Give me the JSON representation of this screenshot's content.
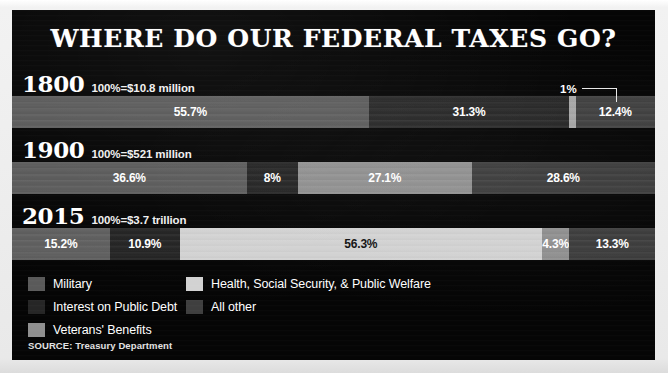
{
  "title": "WHERE DO OUR FEDERAL TAXES GO?",
  "source": "SOURCE: Treasury Department",
  "colors": {
    "panel_background": "#050505",
    "page_background": "#e9e9e9",
    "title_text": "#ffffff",
    "military": "#5a5a5a",
    "interest_on_public_debt": "#262626",
    "veterans_benefits": "#8f8f8f",
    "health_social_security_public_welfare": "#d2d2d2",
    "all_other": "#3f3f3f"
  },
  "callout": {
    "label": "1%",
    "refers_to_row": "1800",
    "refers_to_category": "Veterans' Benefits"
  },
  "legend": {
    "columns": [
      {
        "items": [
          {
            "label": "Military",
            "color": "#5a5a5a",
            "key": "military"
          },
          {
            "label": "Interest on Public Debt",
            "color": "#262626",
            "key": "interest"
          },
          {
            "label": "Veterans' Benefits",
            "color": "#8f8f8f",
            "key": "veterans"
          }
        ]
      },
      {
        "items": [
          {
            "label": "Health, Social Security, & Public Welfare",
            "color": "#d2d2d2",
            "key": "health"
          },
          {
            "label": "All other",
            "color": "#3f3f3f",
            "key": "other"
          }
        ]
      }
    ]
  },
  "rows": [
    {
      "year": "1800",
      "total": "100%=$10.8 million",
      "segments": [
        {
          "label": "55.7%",
          "value": 55.7,
          "key": "military",
          "color": "#5a5a5a",
          "text": "light"
        },
        {
          "label": "31.3%",
          "value": 31.3,
          "key": "interest",
          "color": "#262626",
          "text": "light"
        },
        {
          "label": "",
          "value": 1.0,
          "key": "veterans",
          "color": "#a6a6a6",
          "text": "dark"
        },
        {
          "label": "12.4%",
          "value": 12.4,
          "key": "other",
          "color": "#3f3f3f",
          "text": "light"
        }
      ]
    },
    {
      "year": "1900",
      "total": "100%=$521 million",
      "segments": [
        {
          "label": "36.6%",
          "value": 36.6,
          "key": "military",
          "color": "#5a5a5a",
          "text": "light"
        },
        {
          "label": "8%",
          "value": 8.0,
          "key": "interest",
          "color": "#222222",
          "text": "light"
        },
        {
          "label": "27.1%",
          "value": 27.1,
          "key": "veterans",
          "color": "#8f8f8f",
          "text": "light"
        },
        {
          "label": "28.6%",
          "value": 28.6,
          "key": "other",
          "color": "#3b3b3b",
          "text": "light"
        }
      ]
    },
    {
      "year": "2015",
      "total": "100%=$3.7 trillion",
      "segments": [
        {
          "label": "15.2%",
          "value": 15.2,
          "key": "military",
          "color": "#5e5e5e",
          "text": "light"
        },
        {
          "label": "10.9%",
          "value": 10.9,
          "key": "interest",
          "color": "#232323",
          "text": "light"
        },
        {
          "label": "56.3%",
          "value": 56.3,
          "key": "health",
          "color": "#d2d2d2",
          "text": "dark"
        },
        {
          "label": "4.3%",
          "value": 4.3,
          "key": "veterans",
          "color": "#8f8f8f",
          "text": "light"
        },
        {
          "label": "13.3%",
          "value": 13.3,
          "key": "other",
          "color": "#3b3b3b",
          "text": "light"
        }
      ]
    }
  ],
  "chart_data": {
    "type": "bar",
    "title": "WHERE DO OUR FEDERAL TAXES GO?",
    "subtype": "100% stacked horizontal bar",
    "xlabel": "",
    "ylabel": "",
    "xlim": [
      0,
      100
    ],
    "grid": false,
    "legend_position": "bottom-left",
    "units": "percent of total federal outlays",
    "categories": [
      "1800",
      "1900",
      "2015"
    ],
    "category_totals": [
      "100%=$10.8 million",
      "100%=$521 million",
      "100%=$3.7 trillion"
    ],
    "series": [
      {
        "name": "Military",
        "values": [
          55.7,
          36.6,
          15.2
        ],
        "color": "#5a5a5a"
      },
      {
        "name": "Interest on Public Debt",
        "values": [
          31.3,
          8.0,
          10.9
        ],
        "color": "#262626"
      },
      {
        "name": "Health, Social Security, & Public Welfare",
        "values": [
          null,
          null,
          56.3
        ],
        "color": "#d2d2d2"
      },
      {
        "name": "Veterans' Benefits",
        "values": [
          1.0,
          27.1,
          4.3
        ],
        "color": "#8f8f8f"
      },
      {
        "name": "All other",
        "values": [
          12.4,
          28.6,
          13.3
        ],
        "color": "#3f3f3f"
      }
    ],
    "annotations": [
      {
        "text": "1%",
        "row": "1800",
        "series": "Veterans' Benefits",
        "style": "leader-line"
      }
    ],
    "source": "SOURCE: Treasury Department"
  }
}
